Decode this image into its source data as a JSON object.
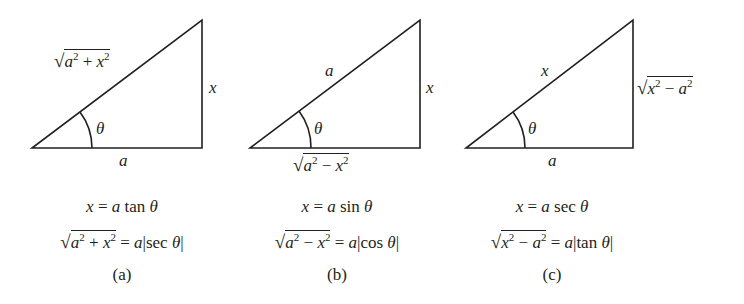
{
  "figure": {
    "panels": [
      {
        "id": "a",
        "caption": "(a)",
        "hypotenuse": "a²+x²",
        "hyp_radicand": {
          "t1": "a",
          "t2": "x",
          "op": "+"
        },
        "opposite": "x",
        "adjacent": "a",
        "angle": "θ",
        "substitution": {
          "lhs": "x",
          "rhs_coef": "a",
          "func": "tan",
          "var": "θ"
        },
        "identity": {
          "radicand": {
            "t1": "a",
            "t2": "x",
            "op": "+"
          },
          "coef": "a",
          "func": "sec",
          "var": "θ"
        }
      },
      {
        "id": "b",
        "caption": "(b)",
        "hypotenuse": "a",
        "opposite": "x",
        "adjacent_radicand": {
          "t1": "a",
          "t2": "x",
          "op": "−"
        },
        "angle": "θ",
        "substitution": {
          "lhs": "x",
          "rhs_coef": "a",
          "func": "sin",
          "var": "θ"
        },
        "identity": {
          "radicand": {
            "t1": "a",
            "t2": "x",
            "op": "−"
          },
          "coef": "a",
          "func": "cos",
          "var": "θ"
        }
      },
      {
        "id": "c",
        "caption": "(c)",
        "hypotenuse": "x",
        "opposite_radicand": {
          "t1": "x",
          "t2": "a",
          "op": "−"
        },
        "adjacent": "a",
        "angle": "θ",
        "substitution": {
          "lhs": "x",
          "rhs_coef": "a",
          "func": "sec",
          "var": "θ"
        },
        "identity": {
          "radicand": {
            "t1": "x",
            "t2": "a",
            "op": "−"
          },
          "coef": "a",
          "func": "tan",
          "var": "θ"
        }
      }
    ],
    "symbols": {
      "sqrt": "√",
      "sq": "2",
      "eq": "=",
      "bar": "|"
    },
    "stroke_color": "#231f20"
  }
}
